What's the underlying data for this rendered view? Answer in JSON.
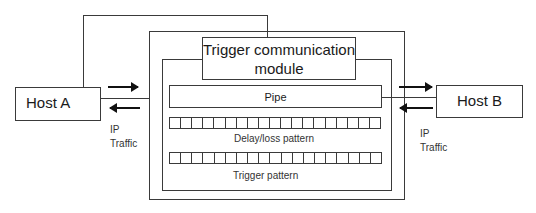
{
  "diagram": {
    "host_a": {
      "label": "Host A"
    },
    "host_b": {
      "label": "Host B"
    },
    "module": {
      "label_line1": "Trigger communication",
      "label_line2": "module"
    },
    "pipe": {
      "label": "Pipe"
    },
    "delay_loss_pattern": {
      "label": "Delay/loss pattern",
      "cell_count": 19
    },
    "trigger_pattern": {
      "label": "Trigger pattern",
      "cell_count": 19
    },
    "traffic_left": {
      "line1": "IP",
      "line2": "Traffic"
    },
    "traffic_right": {
      "line1": "IP",
      "line2": "Traffic"
    }
  }
}
